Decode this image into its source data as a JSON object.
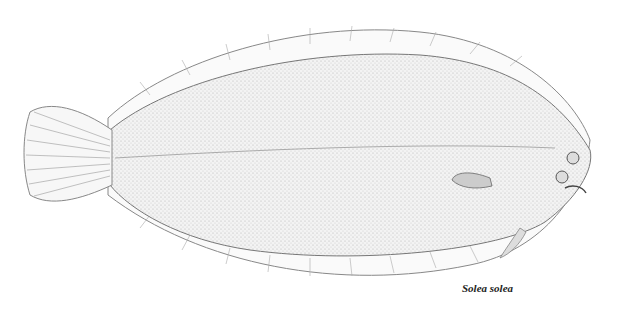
{
  "illustration": {
    "subject": "flatfish line drawing",
    "caption": "Solea solea",
    "colors": {
      "ink": "#555555",
      "fill": "#f2f2f2",
      "background": "#ffffff"
    }
  }
}
